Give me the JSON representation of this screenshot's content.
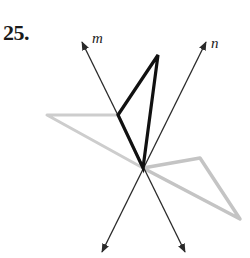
{
  "problem": {
    "number": "25."
  },
  "lines": {
    "m": {
      "label": "m",
      "start": [
        185,
        252
      ],
      "end": [
        82,
        42
      ]
    },
    "n": {
      "label": "n",
      "start": [
        102,
        252
      ],
      "end": [
        206,
        42
      ]
    }
  },
  "intersection": [
    143,
    168
  ],
  "figures": {
    "preimage": {
      "color": "#111111",
      "points": [
        [
          143,
          168
        ],
        [
          158,
          55
        ],
        [
          118,
          115
        ]
      ]
    },
    "reflection_in_m": {
      "color": "#c8c8c8",
      "points": [
        [
          143,
          168
        ],
        [
          47,
          115
        ],
        [
          118,
          115
        ]
      ]
    },
    "reflection_in_n": {
      "color": "#c0c0c0",
      "points": [
        [
          143,
          168
        ],
        [
          200,
          158
        ],
        [
          240,
          219
        ]
      ]
    }
  },
  "colors": {
    "line": "#2a2a2a",
    "preimage": "#111111",
    "image": "#c4c4c4"
  }
}
